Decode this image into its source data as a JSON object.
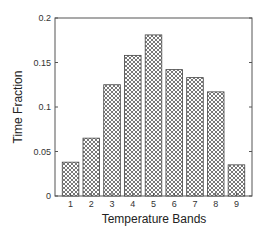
{
  "chart_data": {
    "type": "bar",
    "title": "",
    "xlabel": "Temperature Bands",
    "ylabel": "Time Fraction",
    "categories": [
      "1",
      "2",
      "3",
      "4",
      "5",
      "6",
      "7",
      "8",
      "9"
    ],
    "values": [
      0.038,
      0.065,
      0.125,
      0.158,
      0.181,
      0.142,
      0.133,
      0.117,
      0.035
    ],
    "ylim": [
      0,
      0.2
    ],
    "xlim": [
      0.25,
      9.75
    ],
    "yticks": [
      0,
      0.05,
      0.1,
      0.15,
      0.2
    ],
    "ytick_labels": [
      "0",
      "0.05",
      "0.1",
      "0.15",
      "0.2"
    ],
    "grid": false,
    "legend": null,
    "bar_fill": "crosshatch",
    "colors": {
      "axis": "#555555",
      "bar_edge": "#444444",
      "hatch": "#6a6a6a",
      "background": "#ffffff"
    }
  }
}
